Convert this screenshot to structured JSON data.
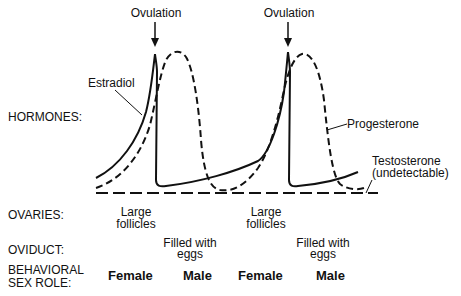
{
  "diagram": {
    "type": "hormone-cycle",
    "annotations": {
      "ovulation_1": "Ovulation",
      "ovulation_2": "Ovulation",
      "estradiol": "Estradiol",
      "progesterone": "Progesterone",
      "testosterone_line1": "Testosterone",
      "testosterone_line2": "(undetectable)"
    },
    "row_labels": {
      "hormones": "HORMONES:",
      "ovaries": "OVARIES:",
      "oviduct": "OVIDUCT:",
      "behavioral_line1": "BEHAVIORAL",
      "behavioral_line2": "SEX ROLE:"
    },
    "ovaries": [
      {
        "line1": "Large",
        "line2": "follicles"
      },
      {
        "line1": "Large",
        "line2": "follicles"
      }
    ],
    "oviduct": [
      {
        "line1": "Filled with",
        "line2": "eggs"
      },
      {
        "line1": "Filled with",
        "line2": "eggs"
      }
    ],
    "sex_roles": [
      "Female",
      "Male",
      "Female",
      "Male"
    ],
    "series": [
      {
        "name": "Estradiol",
        "style": "solid"
      },
      {
        "name": "Progesterone",
        "style": "dashed"
      },
      {
        "name": "Testosterone (undetectable)",
        "style": "dashed-baseline"
      }
    ],
    "colors": {
      "ink": "#111111",
      "background": "#ffffff"
    }
  }
}
